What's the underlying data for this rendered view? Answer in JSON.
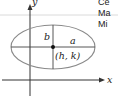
{
  "diagram": {
    "type": "ellipse-horizontal",
    "axes": {
      "x_label": "x",
      "y_label": "y"
    },
    "labels": {
      "semi_minor": "b",
      "semi_major": "a",
      "center": "(h, k)"
    },
    "colors": {
      "ellipse_stroke": "#8a8a8a",
      "axis": "#333333",
      "lines": "#444444",
      "separator": "#cccccc"
    }
  },
  "side_panel": {
    "lines": [
      "Ce",
      "Ma",
      "Mi"
    ]
  }
}
